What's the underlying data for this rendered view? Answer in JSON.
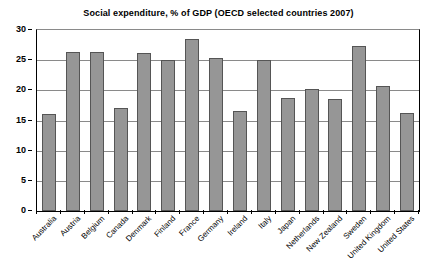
{
  "chart_data": {
    "type": "bar",
    "title": "Social expenditure, % of GDP (OECD selected countries 2007)",
    "xlabel": "",
    "ylabel": "",
    "ylim": [
      0,
      30
    ],
    "ytick_labels": [
      "0",
      "5",
      "10",
      "15",
      "20",
      "25",
      "30"
    ],
    "ytick_values": [
      0,
      5,
      10,
      15,
      20,
      25,
      30
    ],
    "grid": true,
    "legend": false,
    "categories": [
      "Australia",
      "Austria",
      "Belgium",
      "Canada",
      "Denmark",
      "Finland",
      "France",
      "Germany",
      "Ireland",
      "Italy",
      "Japan",
      "Netherlands",
      "New Zealand",
      "Sweden",
      "United Kingdom",
      "United States"
    ],
    "values": [
      16.1,
      26.4,
      26.3,
      17.0,
      26.2,
      25.0,
      28.5,
      25.3,
      16.5,
      25.1,
      18.8,
      20.2,
      18.5,
      27.4,
      20.7,
      16.3
    ],
    "bar_color": "#969696",
    "bar_border_color": "#555555",
    "grid_color": "#8a8a8a",
    "axis_color": "#000000",
    "background_color": "#ffffff"
  }
}
